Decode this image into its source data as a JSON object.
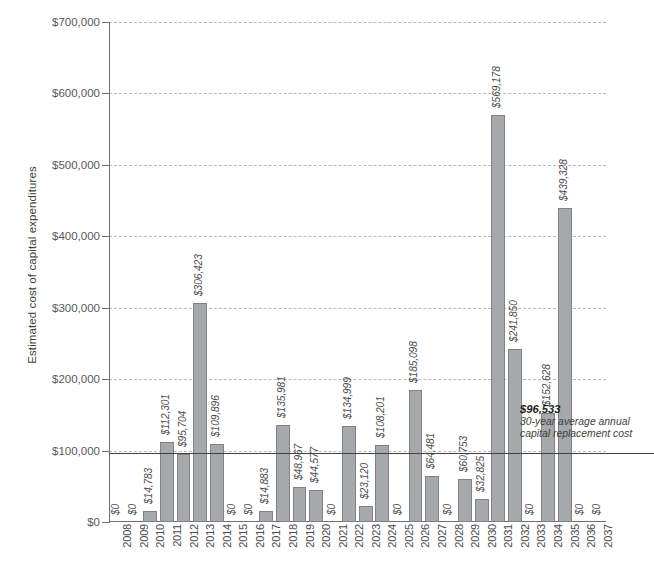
{
  "chart_data": {
    "type": "bar",
    "title": "",
    "xlabel": "",
    "ylabel": "Estimated cost of capital expenditures",
    "ylim": [
      0,
      700000
    ],
    "ytick_labels": [
      "$0",
      "$100,000",
      "$200,000",
      "$300,000",
      "$400,000",
      "$500,000",
      "$600,000",
      "$700,000"
    ],
    "yticks": [
      0,
      100000,
      200000,
      300000,
      400000,
      500000,
      600000,
      700000
    ],
    "grid": true,
    "legend": "none",
    "categories": [
      "2008",
      "2009",
      "2010",
      "2011",
      "2012",
      "2013",
      "2014",
      "2015",
      "2016",
      "2017",
      "2018",
      "2019",
      "2020",
      "2021",
      "2022",
      "2023",
      "2024",
      "2025",
      "2026",
      "2027",
      "2028",
      "2029",
      "2030",
      "2031",
      "2032",
      "2033",
      "2034",
      "2035",
      "2036",
      "2037"
    ],
    "values": [
      0,
      0,
      14783,
      112301,
      95704,
      306423,
      109896,
      0,
      0,
      14883,
      135981,
      48967,
      44577,
      0,
      134999,
      23120,
      108201,
      0,
      185098,
      64481,
      0,
      60753,
      32825,
      569178,
      241850,
      0,
      152628,
      439328,
      0,
      0
    ],
    "data_labels": [
      "$0",
      "$0",
      "$14,783",
      "$112,301",
      "$95,704",
      "$306,423",
      "$109,896",
      "$0",
      "$0",
      "$14,883",
      "$135,981",
      "$48,967",
      "$44,577",
      "$0",
      "$134,999",
      "$23,120",
      "$108,201",
      "$0",
      "$185,098",
      "$64,481",
      "$0",
      "$60,753",
      "$32,825",
      "$569,178",
      "$241,850",
      "$0",
      "$152,628",
      "$439,328",
      "$0",
      "$0"
    ],
    "threshold": {
      "value": 96533,
      "label": "$96,533",
      "description": "30-year average annual capital replacement cost"
    },
    "bar_color": "#a6a8ab",
    "bar_border_color": "#808285",
    "axis_color": "#6d6e71",
    "gridline_color": "#b9b9bb",
    "threshold_color": "#404041"
  },
  "footer": {
    "caption": ""
  }
}
